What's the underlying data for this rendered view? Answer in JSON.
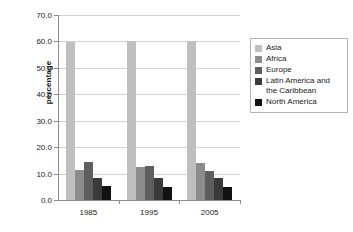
{
  "chart_data": {
    "type": "bar",
    "title": "",
    "xlabel": "",
    "ylabel": "percentage",
    "categories": [
      "1985",
      "1995",
      "2005"
    ],
    "ylim": [
      0.0,
      70.0
    ],
    "ytick_step": 10.0,
    "ytick_labels": [
      "0.0",
      "10.0",
      "20.0",
      "30.0",
      "40.0",
      "50.0",
      "60.0",
      "70.0"
    ],
    "ytick_values": [
      0.0,
      10.0,
      20.0,
      30.0,
      40.0,
      50.0,
      60.0,
      70.0
    ],
    "grid": true,
    "legend_position": "right",
    "series": [
      {
        "name": "Asia",
        "color": "#bfbfbf",
        "values": [
          59.8,
          60.2,
          60.2
        ]
      },
      {
        "name": "Africa",
        "color": "#8c8c8c",
        "values": [
          11.4,
          12.5,
          14.0
        ]
      },
      {
        "name": "Europe",
        "color": "#5e5e5e",
        "values": [
          14.5,
          12.7,
          11.1
        ]
      },
      {
        "name": "Latin America and the Caribbean",
        "color": "#3a3a3a",
        "values": [
          8.3,
          8.4,
          8.4
        ]
      },
      {
        "name": "North America",
        "color": "#121212",
        "values": [
          5.4,
          5.1,
          5.1
        ]
      }
    ]
  },
  "legend": {
    "entries": [
      {
        "label": "Asia",
        "color": "#bfbfbf"
      },
      {
        "label": "Africa",
        "color": "#8c8c8c"
      },
      {
        "label": "Europe",
        "color": "#5e5e5e"
      },
      {
        "label": "Latin America and\nthe Caribbean",
        "color": "#3a3a3a"
      },
      {
        "label": "North America",
        "color": "#121212"
      }
    ]
  },
  "axes": {
    "y_title": "percentage"
  }
}
